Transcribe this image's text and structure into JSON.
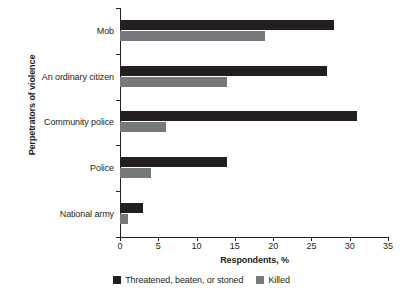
{
  "chart_data": {
    "type": "bar",
    "orientation": "horizontal",
    "title": "",
    "xlabel": "Respondents, %",
    "ylabel": "Perpetrators of violence",
    "categories": [
      "Mob",
      "An ordinary citizen",
      "Community police",
      "Police",
      "National army"
    ],
    "series": [
      {
        "name": "Threatened, beaten, or stoned",
        "color": "#231f20",
        "values": [
          28,
          27,
          31,
          14,
          3
        ]
      },
      {
        "name": "Killed",
        "color": "#77787b",
        "values": [
          19,
          14,
          6,
          4,
          1
        ]
      }
    ],
    "xlim": [
      0,
      35
    ],
    "xticks": [
      0,
      5,
      10,
      15,
      20,
      25,
      30,
      35
    ],
    "xtick_labels": [
      "0",
      "5",
      "10",
      "15",
      "20",
      "25",
      "30",
      "35"
    ],
    "grid": false,
    "legend_position": "bottom"
  }
}
